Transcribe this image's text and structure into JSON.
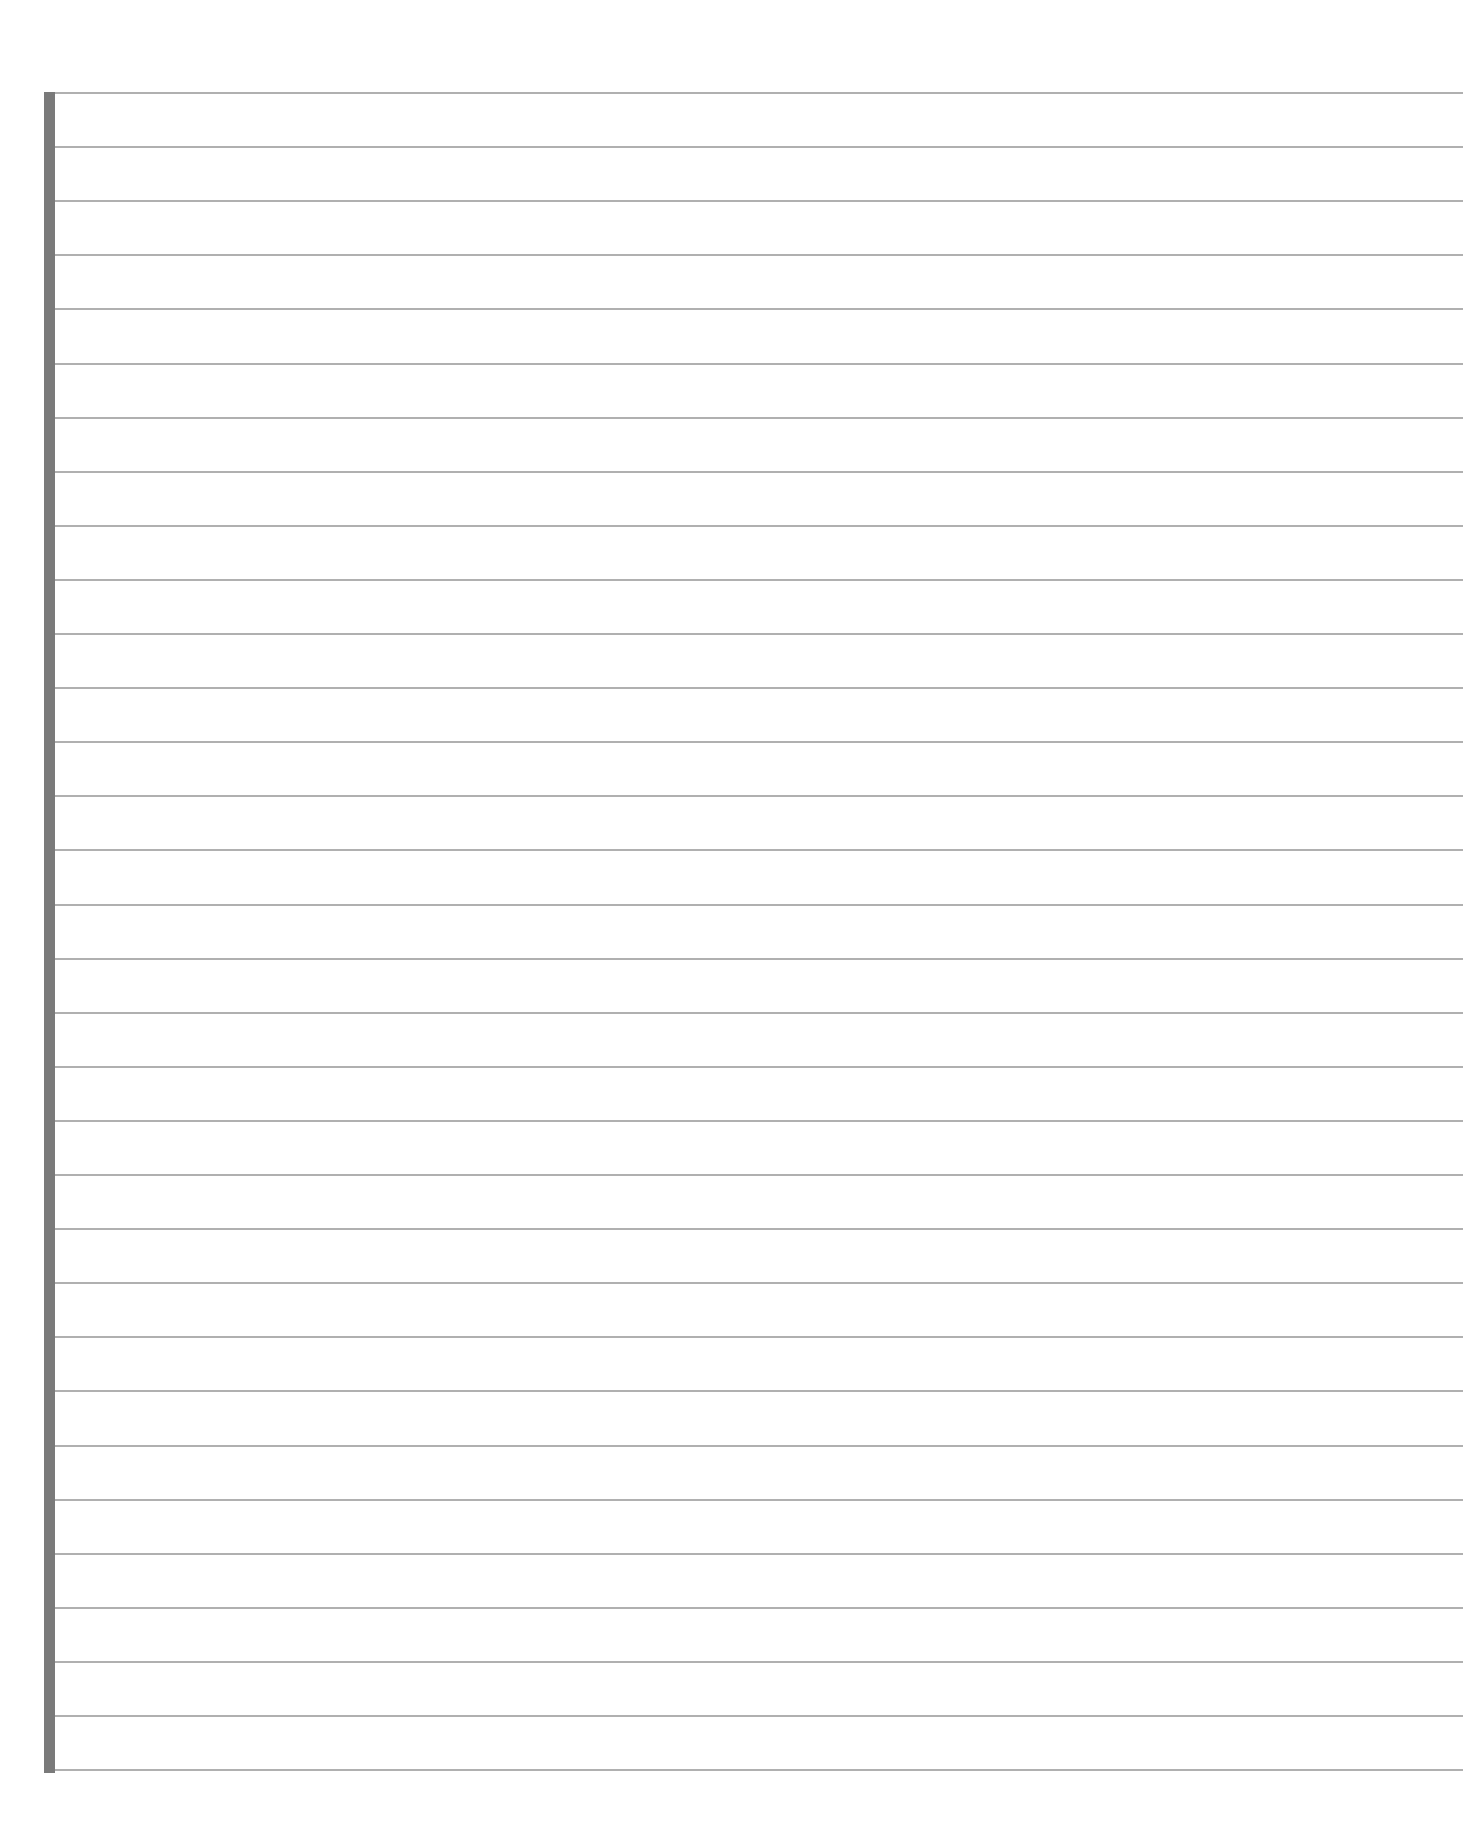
{
  "page": {
    "type": "lined-paper",
    "background_color": "#ffffff",
    "margin_bar": {
      "color": "#7a7a7a",
      "x": 44,
      "width": 11,
      "top": 92,
      "bottom": 1773
    },
    "ruled_lines": {
      "color": "#b0b0b0",
      "count": 32,
      "first_y": 93,
      "spacing": 54.1,
      "x_start": 55,
      "x_end": 1463
    }
  }
}
